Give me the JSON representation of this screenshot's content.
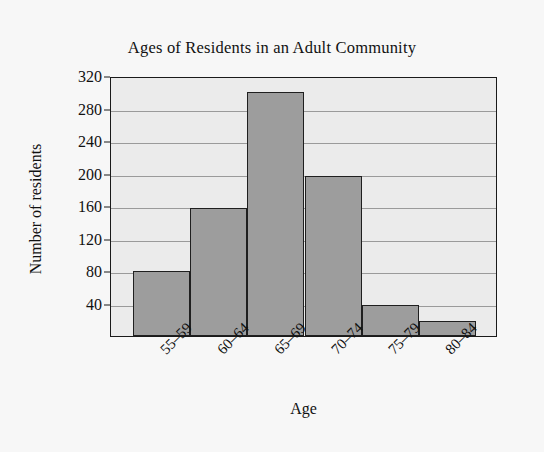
{
  "chart_data": {
    "type": "bar",
    "title": "Ages of Residents in an Adult Community",
    "xlabel": "Age",
    "ylabel": "Number of residents",
    "categories": [
      "55–59",
      "60–64",
      "65–69",
      "70–74",
      "75–79",
      "80–84"
    ],
    "values": [
      80,
      158,
      300,
      197,
      38,
      18
    ],
    "ylim": [
      0,
      320
    ],
    "ytick_labels": [
      "40",
      "80",
      "120",
      "160",
      "200",
      "240",
      "280",
      "320"
    ],
    "ytick_values": [
      40,
      80,
      120,
      160,
      200,
      240,
      280,
      320
    ],
    "grid": "horizontal",
    "legend": "none",
    "bar_color": "#9d9d9d",
    "bar_edge_color": "#1f1f1f",
    "plot_background": "#ebebeb",
    "page_background": "#f7f7f7",
    "axis_color": "#1a1a1a",
    "gridline_color": "#9a9a9a"
  }
}
